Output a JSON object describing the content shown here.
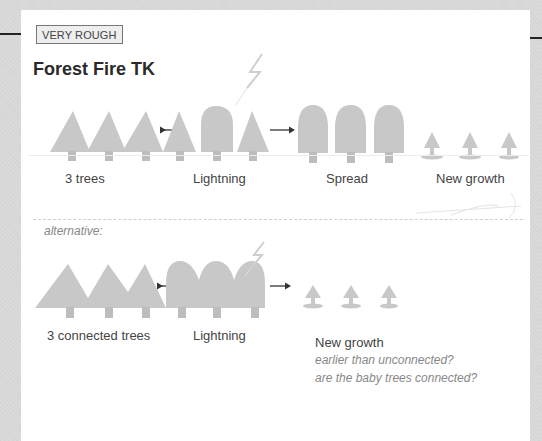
{
  "document": {
    "badge": "VERY ROUGH",
    "title": "Forest Fire TK",
    "colors": {
      "tree_fill": "#c8c8c8",
      "trunk_fill": "#bdbdbd",
      "arrow": "#333333",
      "lightning": "#cfcfcf",
      "paper": "#ffffff",
      "margin": "#d9d9d9"
    }
  },
  "sequence_main": {
    "steps": [
      {
        "label": "3 trees",
        "icon": "three-pine-trees"
      },
      {
        "label": "Lightning",
        "icon": "lightning-strike-trees"
      },
      {
        "label": "Spread",
        "icon": "three-burnt-trees"
      },
      {
        "label": "New growth",
        "icon": "three-saplings"
      }
    ]
  },
  "sequence_alternative": {
    "heading": "alternative:",
    "steps": [
      {
        "label": "3 connected trees",
        "icon": "connected-pine-trees"
      },
      {
        "label": "Lightning",
        "icon": "connected-burnt-trees"
      },
      {
        "label": "New growth",
        "icon": "three-saplings"
      }
    ],
    "notes": [
      "earlier than unconnected?",
      "are the baby trees connected?"
    ]
  }
}
